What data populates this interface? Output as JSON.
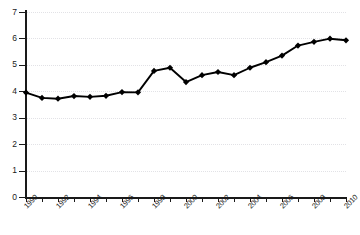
{
  "chart_data": {
    "type": "line",
    "title": "",
    "subtitle": "",
    "xlabel": "",
    "ylabel": "",
    "xlim": [
      1990,
      2010
    ],
    "ylim": [
      0,
      7
    ],
    "grid": true,
    "legend": "none",
    "marker": "diamond",
    "line_color": "#000000",
    "marker_color": "#000000",
    "grid_color": "#e2e2e6",
    "axis_color": "#1a1a1a",
    "x_tick_labels": [
      "1990",
      "1992",
      "1994",
      "1996",
      "1998",
      "2000",
      "2002",
      "2004",
      "2006",
      "2008",
      "2010"
    ],
    "y_tick_labels": [
      "0",
      "1",
      "2",
      "3",
      "4",
      "5",
      "6",
      "7"
    ],
    "y_ticks": [
      0,
      1,
      2,
      3,
      4,
      5,
      6,
      7
    ],
    "x_ticks": [
      1990,
      1991,
      1992,
      1993,
      1994,
      1995,
      1996,
      1997,
      1998,
      1999,
      2000,
      2001,
      2002,
      2003,
      2004,
      2005,
      2006,
      2007,
      2008,
      2009,
      2010
    ],
    "categories": [
      1990,
      1991,
      1992,
      1993,
      1994,
      1995,
      1996,
      1997,
      1998,
      1999,
      2000,
      2001,
      2002,
      2003,
      2004,
      2005,
      2006,
      2007,
      2008,
      2009,
      2010
    ],
    "values": [
      3.95,
      3.75,
      3.72,
      3.82,
      3.79,
      3.83,
      3.97,
      3.96,
      4.77,
      4.89,
      4.35,
      4.61,
      4.73,
      4.61,
      4.89,
      5.1,
      5.35,
      5.73,
      5.87,
      5.99,
      5.93
    ],
    "series": [
      {
        "name": "series-1",
        "values": [
          3.95,
          3.75,
          3.72,
          3.82,
          3.79,
          3.83,
          3.97,
          3.96,
          4.77,
          4.89,
          4.35,
          4.61,
          4.73,
          4.61,
          4.89,
          5.1,
          5.35,
          5.73,
          5.87,
          5.99,
          5.93
        ]
      }
    ]
  }
}
